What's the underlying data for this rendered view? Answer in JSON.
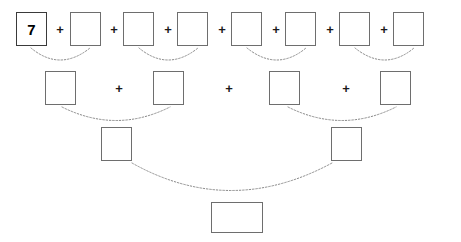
{
  "worksheet": {
    "type": "addition-pyramid",
    "width": 461,
    "height": 242,
    "background_color": "#ffffff",
    "box_border_color": "#6e6e6e",
    "filled_box_border_color": "#3a3a3a",
    "arc_color": "#8a8a8a",
    "operator_symbol": "+"
  },
  "rows": [
    {
      "name": "row-1",
      "box_count": 8,
      "box_width": 31,
      "box_height": 34,
      "top": 12,
      "boxes": [
        {
          "value": "7",
          "filled": true,
          "left": 16
        },
        {
          "value": "",
          "filled": false,
          "left": 70
        },
        {
          "value": "",
          "filled": false,
          "left": 123
        },
        {
          "value": "",
          "filled": false,
          "left": 177
        },
        {
          "value": "",
          "filled": false,
          "left": 231
        },
        {
          "value": "",
          "filled": false,
          "left": 285
        },
        {
          "value": "",
          "filled": false,
          "left": 339
        },
        {
          "value": "",
          "filled": false,
          "left": 393
        }
      ],
      "operators": [
        {
          "label": "+",
          "left": 54,
          "top": 23
        },
        {
          "label": "+",
          "left": 108,
          "top": 23
        },
        {
          "label": "+",
          "left": 162,
          "top": 23
        },
        {
          "label": "+",
          "left": 216,
          "top": 23
        },
        {
          "label": "+",
          "left": 270,
          "top": 23
        },
        {
          "label": "+",
          "left": 324,
          "top": 23
        },
        {
          "label": "+",
          "left": 378,
          "top": 23
        }
      ]
    },
    {
      "name": "row-2",
      "box_count": 4,
      "box_width": 31,
      "box_height": 34,
      "top": 71,
      "boxes": [
        {
          "value": "",
          "filled": false,
          "left": 45
        },
        {
          "value": "",
          "filled": false,
          "left": 153
        },
        {
          "value": "",
          "filled": false,
          "left": 269
        },
        {
          "value": "",
          "filled": false,
          "left": 380
        }
      ],
      "operators": [
        {
          "label": "+",
          "left": 113,
          "top": 82
        },
        {
          "label": "+",
          "left": 223,
          "top": 82
        },
        {
          "label": "+",
          "left": 340,
          "top": 82
        }
      ]
    },
    {
      "name": "row-3",
      "box_count": 2,
      "box_width": 31,
      "box_height": 34,
      "top": 127,
      "boxes": [
        {
          "value": "",
          "filled": false,
          "left": 101
        },
        {
          "value": "",
          "filled": false,
          "left": 331
        }
      ],
      "operators": []
    },
    {
      "name": "row-4",
      "box_count": 1,
      "box_width": 52,
      "box_height": 31,
      "top": 202,
      "boxes": [
        {
          "value": "",
          "filled": false,
          "left": 211
        }
      ],
      "operators": []
    }
  ],
  "arcs": [
    {
      "name": "arc-r1-pair-1",
      "start_x": 31,
      "start_y": 48,
      "ctrl_x": 60,
      "ctrl_y": 72,
      "end_x": 90,
      "end_y": 48
    },
    {
      "name": "arc-r1-pair-2",
      "start_x": 139,
      "start_y": 48,
      "ctrl_x": 168,
      "ctrl_y": 72,
      "end_x": 198,
      "end_y": 48
    },
    {
      "name": "arc-r1-pair-3",
      "start_x": 247,
      "start_y": 48,
      "ctrl_x": 277,
      "ctrl_y": 72,
      "end_x": 306,
      "end_y": 48
    },
    {
      "name": "arc-r1-pair-4",
      "start_x": 355,
      "start_y": 48,
      "ctrl_x": 385,
      "ctrl_y": 72,
      "end_x": 414,
      "end_y": 48
    },
    {
      "name": "arc-r2-pair-1",
      "start_x": 62,
      "start_y": 107,
      "ctrl_x": 116,
      "ctrl_y": 134,
      "end_x": 170,
      "end_y": 107
    },
    {
      "name": "arc-r2-pair-2",
      "start_x": 288,
      "start_y": 107,
      "ctrl_x": 342,
      "ctrl_y": 134,
      "end_x": 396,
      "end_y": 107
    },
    {
      "name": "arc-r3-pair-1",
      "start_x": 132,
      "start_y": 163,
      "ctrl_x": 230,
      "ctrl_y": 218,
      "end_x": 332,
      "end_y": 163
    }
  ]
}
